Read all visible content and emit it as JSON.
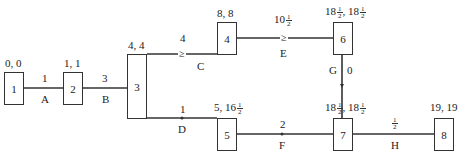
{
  "diagram": {
    "type": "activity-network",
    "nodes": [
      {
        "id": "1",
        "label": "1",
        "times": "0, 0"
      },
      {
        "id": "2",
        "label": "2",
        "times": "1, 1"
      },
      {
        "id": "3",
        "label": "3",
        "times": "4, 4"
      },
      {
        "id": "4",
        "label": "4",
        "times": "8, 8"
      },
      {
        "id": "5",
        "label": "5",
        "times_a": "5, 16",
        "times_frac": "1/2"
      },
      {
        "id": "6",
        "label": "6",
        "times_a": "18",
        "times_b": ", 18"
      },
      {
        "id": "7",
        "label": "7",
        "times_a": "18",
        "times_b": ", 18"
      },
      {
        "id": "8",
        "label": "8",
        "times": "19, 19"
      }
    ],
    "edges": [
      {
        "activity": "A",
        "from": "1",
        "to": "2",
        "duration": "1"
      },
      {
        "activity": "B",
        "from": "2",
        "to": "3",
        "duration": "3"
      },
      {
        "activity": "C",
        "from": "3",
        "to": "4",
        "duration": "4",
        "marker": "≥"
      },
      {
        "activity": "D",
        "from": "3",
        "to": "5",
        "duration": "1"
      },
      {
        "activity": "E",
        "from": "4",
        "to": "6",
        "duration": "10",
        "duration_frac": "1/2",
        "marker": "≥"
      },
      {
        "activity": "F",
        "from": "5",
        "to": "7",
        "duration": "2"
      },
      {
        "activity": "G",
        "from": "6",
        "to": "7",
        "duration": "0"
      },
      {
        "activity": "H",
        "from": "7",
        "to": "8",
        "duration_frac": "1/2"
      }
    ],
    "frac": {
      "num": "1",
      "den": "2"
    }
  }
}
